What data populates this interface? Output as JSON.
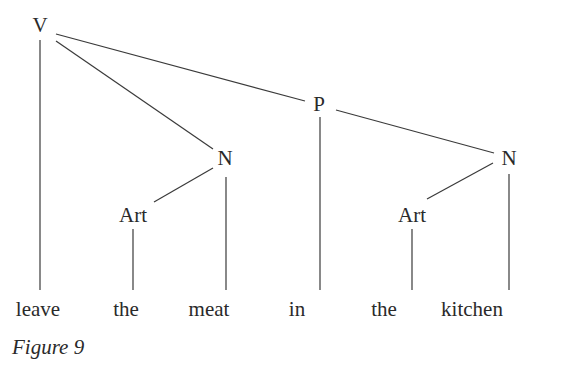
{
  "diagram": {
    "type": "syntax-tree",
    "nodes": [
      {
        "id": "V",
        "label": "V",
        "x": 40,
        "y": 32
      },
      {
        "id": "N1",
        "label": "N",
        "x": 225,
        "y": 165
      },
      {
        "id": "P",
        "label": "P",
        "x": 319,
        "y": 111
      },
      {
        "id": "N2",
        "label": "N",
        "x": 509,
        "y": 165
      },
      {
        "id": "Art1",
        "label": "Art",
        "x": 133,
        "y": 222
      },
      {
        "id": "Art2",
        "label": "Art",
        "x": 412,
        "y": 222
      }
    ],
    "words": [
      {
        "label": "leave",
        "x": 38,
        "y": 316
      },
      {
        "label": "the",
        "x": 126,
        "y": 316
      },
      {
        "label": "meat",
        "x": 209,
        "y": 316
      },
      {
        "label": "in",
        "x": 297,
        "y": 316
      },
      {
        "label": "the",
        "x": 384,
        "y": 316
      },
      {
        "label": "kitchen",
        "x": 472,
        "y": 316
      }
    ],
    "edges": [
      {
        "from": "V",
        "to": "leave",
        "x1": 40,
        "y1": 40,
        "x2": 40,
        "y2": 290
      },
      {
        "from": "V",
        "to": "N1",
        "x1": 56,
        "y1": 41,
        "x2": 213,
        "y2": 149
      },
      {
        "from": "V",
        "to": "P",
        "x1": 56,
        "y1": 34,
        "x2": 305,
        "y2": 101
      },
      {
        "from": "N1",
        "to": "Art1",
        "x1": 213,
        "y1": 168,
        "x2": 154,
        "y2": 202
      },
      {
        "from": "N1",
        "to": "meat",
        "x1": 226,
        "y1": 177,
        "x2": 226,
        "y2": 290
      },
      {
        "from": "Art1",
        "to": "the",
        "x1": 133,
        "y1": 229,
        "x2": 133,
        "y2": 290
      },
      {
        "from": "P",
        "to": "in",
        "x1": 320,
        "y1": 117,
        "x2": 320,
        "y2": 290
      },
      {
        "from": "P",
        "to": "N2",
        "x1": 336,
        "y1": 110,
        "x2": 494,
        "y2": 153
      },
      {
        "from": "N2",
        "to": "Art2",
        "x1": 493,
        "y1": 163,
        "x2": 427,
        "y2": 199
      },
      {
        "from": "N2",
        "to": "kitchen",
        "x1": 509,
        "y1": 174,
        "x2": 509,
        "y2": 290
      },
      {
        "from": "Art2",
        "to": "the",
        "x1": 412,
        "y1": 229,
        "x2": 412,
        "y2": 290
      }
    ],
    "caption": "Figure 9"
  }
}
